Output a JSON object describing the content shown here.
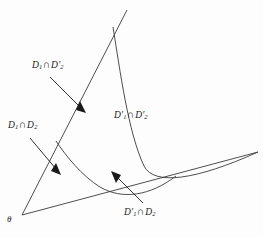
{
  "figure": {
    "name": "set-intersection-regions-diagram",
    "background_color": "#fdfdfd",
    "stroke_color": "#3a3a3a",
    "text_color": "#1a1a1a",
    "width": 263,
    "height": 238
  },
  "origin": {
    "symbol": "θ",
    "x": 22,
    "y": 215
  },
  "labels": [
    {
      "id": "region-d1-cap-d2prime",
      "text": "D₁ ∩ D′₂",
      "base": "D",
      "sub1": "1",
      "prime1": "",
      "operator": "∩",
      "base2": "D",
      "prime2": "′",
      "sub2": "2",
      "x": 32,
      "y": 60,
      "arrow": {
        "x1": 50,
        "y1": 77,
        "x2": 83,
        "y2": 110
      }
    },
    {
      "id": "region-d1-cap-d2",
      "text": "D₁ ∩ D₂",
      "base": "D",
      "sub1": "1",
      "prime1": "",
      "operator": "∩",
      "base2": "D",
      "prime2": "",
      "sub2": "2",
      "x": 8,
      "y": 120,
      "arrow": {
        "x1": 30,
        "y1": 138,
        "x2": 58,
        "y2": 172
      }
    },
    {
      "id": "region-d1prime-cap-d2prime",
      "text": "D′₁ ∩ D′₂",
      "base": "D",
      "prime1": "′",
      "sub1": "1",
      "operator": "∩",
      "base2": "D",
      "prime2": "′",
      "sub2": "2",
      "x": 114,
      "y": 110,
      "arrow": null
    },
    {
      "id": "region-d1prime-cap-d2",
      "text": "D′₁ ∩ D₂",
      "base": "D",
      "prime1": "′",
      "sub1": "1",
      "operator": "∩",
      "base2": "D",
      "prime2": "",
      "sub2": "2",
      "x": 124,
      "y": 207,
      "arrow": {
        "x1": 143,
        "y1": 203,
        "x2": 113,
        "y2": 173
      }
    }
  ],
  "geometry": {
    "ray_steep": {
      "from": [
        22,
        215
      ],
      "to": [
        127,
        10
      ]
    },
    "ray_shallow": {
      "from": [
        22,
        215
      ],
      "to": [
        258,
        152
      ]
    },
    "curve_hyperbola": "M 113 27 C 122 78, 132 140, 148 172 C 160 190, 200 178, 258 152",
    "curve_second": "M 56 141 C 74 160, 92 178, 112 190 C 132 201, 152 198, 176 176"
  }
}
